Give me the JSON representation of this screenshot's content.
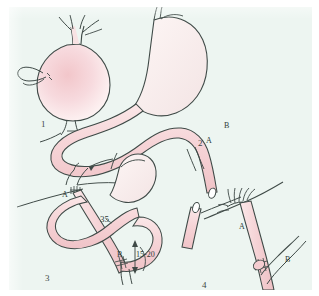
{
  "figure": {
    "kind": "medical-surgical-line-illustration",
    "caption_panels": 4,
    "background_color": "#edf5f1",
    "page_color": "#ffffff",
    "ink_color": "#3a4442",
    "tissue_fill_color": "#f6d7d9",
    "tissue_fill_light": "#fbeced",
    "width_px": 319,
    "height_px": 296
  },
  "panels": [
    {
      "number": "1",
      "title": "stomach with vessels",
      "labels": []
    },
    {
      "number": "2",
      "title": "mobilized jejunal loop divided",
      "labels": [
        "A",
        "B"
      ]
    },
    {
      "number": "3",
      "title": "roux limb reconstruction with measurements",
      "labels": [
        "A",
        "B"
      ],
      "measurements": [
        "35",
        "15-20"
      ]
    },
    {
      "number": "4",
      "title": "detail of anastomoses",
      "labels": [
        "A",
        "B"
      ]
    }
  ],
  "panel_numbers": {
    "one": "1",
    "two": "2",
    "three": "3",
    "four": "4"
  },
  "labels": {
    "panel2_a": "A",
    "panel2_b": "B",
    "panel3_a": "A",
    "panel3_b": "B",
    "panel3_length_upper": "35",
    "panel3_length_lower": "15-20",
    "panel4_a": "A",
    "panel4_b": "B"
  }
}
